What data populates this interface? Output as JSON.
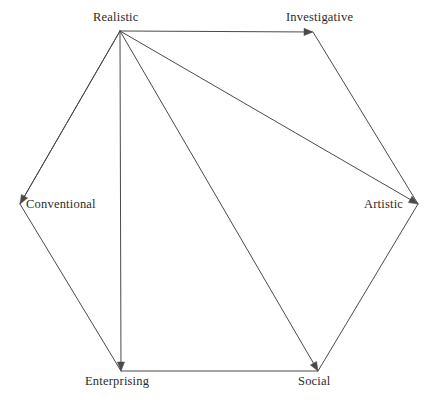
{
  "chart_data": {
    "type": "diagram",
    "title": "",
    "subtitle": "",
    "xlabel": "",
    "ylabel": "",
    "legend": [],
    "grid": false,
    "background_color": "#ffffff",
    "line_color": "#4a4a4a",
    "text_color": "#2b2b2b",
    "canvas": {
      "width": 436,
      "height": 400
    },
    "shape": "hexagon",
    "nodes": [
      {
        "id": "realistic",
        "label": "Realistic",
        "x": 120,
        "y": 31,
        "label_x": 93,
        "label_y": 11,
        "label_anchor": "above"
      },
      {
        "id": "investigative",
        "label": "Investigative",
        "x": 313,
        "y": 32,
        "label_x": 286,
        "label_y": 11,
        "label_anchor": "above"
      },
      {
        "id": "artistic",
        "label": "Artistic",
        "x": 418,
        "y": 204,
        "label_x": 364,
        "label_y": 198,
        "label_anchor": "left"
      },
      {
        "id": "social",
        "label": "Social",
        "x": 318,
        "y": 371,
        "label_x": 298,
        "label_y": 375,
        "label_anchor": "below"
      },
      {
        "id": "enterprising",
        "label": "Enterprising",
        "x": 121,
        "y": 371,
        "label_x": 85,
        "label_y": 375,
        "label_anchor": "below"
      },
      {
        "id": "conventional",
        "label": "Conventional",
        "x": 20,
        "y": 204,
        "label_x": 26,
        "label_y": 198,
        "label_anchor": "right"
      }
    ],
    "edges": [
      {
        "id": "realistic-investigative",
        "from": "realistic",
        "to": "investigative",
        "arrow": true,
        "kind": "perimeter"
      },
      {
        "id": "investigative-artistic",
        "from": "investigative",
        "to": "artistic",
        "arrow": false,
        "kind": "perimeter"
      },
      {
        "id": "artistic-social",
        "from": "artistic",
        "to": "social",
        "arrow": false,
        "kind": "perimeter"
      },
      {
        "id": "social-enterprising",
        "from": "social",
        "to": "enterprising",
        "arrow": false,
        "kind": "perimeter"
      },
      {
        "id": "enterprising-conventional",
        "from": "enterprising",
        "to": "conventional",
        "arrow": false,
        "kind": "perimeter"
      },
      {
        "id": "conventional-realistic",
        "from": "conventional",
        "to": "realistic",
        "arrow": false,
        "kind": "perimeter"
      },
      {
        "id": "realistic-conventional",
        "from": "realistic",
        "to": "conventional",
        "arrow": true,
        "kind": "spoke"
      },
      {
        "id": "realistic-enterprising",
        "from": "realistic",
        "to": "enterprising",
        "arrow": true,
        "kind": "spoke"
      },
      {
        "id": "realistic-social",
        "from": "realistic",
        "to": "social",
        "arrow": true,
        "kind": "spoke"
      },
      {
        "id": "realistic-artistic",
        "from": "realistic",
        "to": "artistic",
        "arrow": true,
        "kind": "spoke"
      }
    ]
  }
}
